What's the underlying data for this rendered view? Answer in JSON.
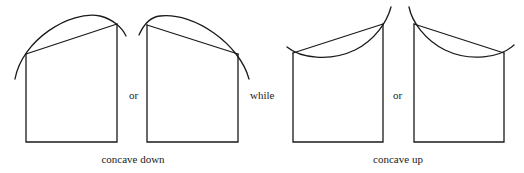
{
  "labels": {
    "or_1": "or",
    "while": "while",
    "or_2": "or",
    "concave_down": "concave down",
    "concave_up": "concave up"
  },
  "colors": {
    "background": "#ffffff",
    "stroke": "#1a1a1a",
    "text": "#222222"
  },
  "panels": [
    {
      "name": "concave-down-rising-chord",
      "group": "concave down",
      "chord": "rising"
    },
    {
      "name": "concave-down-falling-chord",
      "group": "concave down",
      "chord": "falling"
    },
    {
      "name": "concave-up-rising-chord",
      "group": "concave up",
      "chord": "rising"
    },
    {
      "name": "concave-up-falling-chord",
      "group": "concave up",
      "chord": "falling"
    }
  ]
}
